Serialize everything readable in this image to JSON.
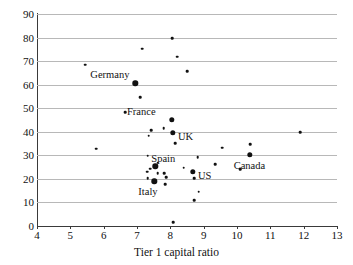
{
  "chart_data": {
    "type": "scatter",
    "title": "",
    "xlabel": "Tier 1 capital ratio",
    "ylabel": "",
    "xlim": [
      4,
      13
    ],
    "ylim": [
      0,
      90
    ],
    "xticks": [
      4,
      5,
      6,
      7,
      8,
      9,
      10,
      11,
      12,
      13
    ],
    "yticks": [
      0,
      10,
      20,
      30,
      40,
      50,
      60,
      70,
      80,
      90
    ],
    "grid": "horizontal",
    "legend": "none",
    "series": [
      {
        "name": "banks",
        "marker": "small",
        "points": [
          {
            "x": 5.45,
            "y": 68.4
          },
          {
            "x": 8.05,
            "y": 79.6
          },
          {
            "x": 7.15,
            "y": 75.3
          },
          {
            "x": 8.2,
            "y": 71.8
          },
          {
            "x": 8.5,
            "y": 65.8
          },
          {
            "x": 7.1,
            "y": 54.6
          },
          {
            "x": 6.65,
            "y": 48.4
          },
          {
            "x": 7.8,
            "y": 41.6
          },
          {
            "x": 7.42,
            "y": 40.6
          },
          {
            "x": 7.35,
            "y": 38.4
          },
          {
            "x": 11.9,
            "y": 39.8
          },
          {
            "x": 8.15,
            "y": 35.1
          },
          {
            "x": 5.78,
            "y": 32.8
          },
          {
            "x": 9.55,
            "y": 33.3
          },
          {
            "x": 10.4,
            "y": 34.6
          },
          {
            "x": 7.32,
            "y": 29.8
          },
          {
            "x": 8.82,
            "y": 29.3
          },
          {
            "x": 9.35,
            "y": 26.2
          },
          {
            "x": 7.62,
            "y": 26.8
          },
          {
            "x": 8.4,
            "y": 24.8
          },
          {
            "x": 7.4,
            "y": 24.4
          },
          {
            "x": 7.3,
            "y": 23.0
          },
          {
            "x": 7.62,
            "y": 22.4
          },
          {
            "x": 7.82,
            "y": 22.3
          },
          {
            "x": 10.1,
            "y": 24.1
          },
          {
            "x": 7.88,
            "y": 20.6
          },
          {
            "x": 7.32,
            "y": 20.4
          },
          {
            "x": 8.72,
            "y": 20.3
          },
          {
            "x": 7.85,
            "y": 17.8
          },
          {
            "x": 8.85,
            "y": 14.6
          },
          {
            "x": 8.72,
            "y": 11.0
          },
          {
            "x": 8.08,
            "y": 1.5
          }
        ]
      },
      {
        "name": "labelled countries",
        "marker": "big",
        "points": [
          {
            "x": 6.95,
            "y": 60.6,
            "label": "Germany",
            "label_pos": "above-left"
          },
          {
            "x": 8.05,
            "y": 45.0,
            "label": "France",
            "label_pos": "above-left"
          },
          {
            "x": 8.08,
            "y": 39.6,
            "label": "UK",
            "label_pos": "right"
          },
          {
            "x": 7.55,
            "y": 25.4,
            "label": "Spain",
            "label_pos": "above-right"
          },
          {
            "x": 7.52,
            "y": 18.9,
            "label": "Italy",
            "label_pos": "below-left"
          },
          {
            "x": 8.68,
            "y": 22.9,
            "label": "US",
            "label_pos": "right"
          },
          {
            "x": 10.38,
            "y": 30.2,
            "label": "Canada",
            "label_pos": "below-left"
          }
        ]
      }
    ]
  },
  "colors": {
    "marker": "#111111",
    "gridline": "#b8b8b8",
    "axis": "#3a3a3a",
    "background": "#ffffff"
  }
}
